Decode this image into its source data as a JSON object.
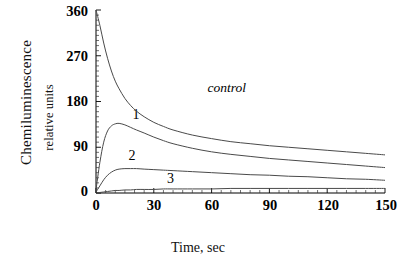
{
  "chart_data": {
    "type": "line",
    "title": "",
    "xlabel": "Time, sec",
    "ylabel": "Chemiluminescence relative units",
    "ylabel_line1": "Chemiluminescence",
    "ylabel_line2": "relative units",
    "xlim": [
      0,
      150
    ],
    "ylim": [
      0,
      360
    ],
    "xticks": [
      0,
      30,
      60,
      90,
      120,
      150
    ],
    "yticks": [
      0,
      90,
      180,
      270,
      360
    ],
    "xtick_labels": [
      "0",
      "30",
      "60",
      "90",
      "120",
      "150"
    ],
    "ytick_labels": [
      "0",
      "90",
      "180",
      "270",
      "360"
    ],
    "grid": false,
    "legend": "inline-curve-labels",
    "x": [
      0,
      2,
      4,
      6,
      8,
      10,
      12,
      15,
      18,
      21,
      25,
      30,
      35,
      40,
      50,
      60,
      70,
      80,
      90,
      100,
      110,
      120,
      130,
      140,
      150
    ],
    "series": [
      {
        "name": "control",
        "label": "control",
        "label_style": "italic",
        "values": [
          360,
          330,
          295,
          265,
          240,
          220,
          205,
          186,
          172,
          161,
          150,
          139,
          131,
          124,
          114,
          107,
          101,
          97,
          93,
          90,
          87,
          84,
          81,
          78,
          75
        ]
      },
      {
        "name": "1",
        "label": "1",
        "label_style": "plain",
        "values": [
          6,
          60,
          100,
          122,
          132,
          136,
          137,
          134,
          129,
          124,
          118,
          110,
          103,
          97,
          88,
          81,
          76,
          72,
          68,
          65,
          62,
          59,
          56,
          53,
          50
        ]
      },
      {
        "name": "2",
        "label": "2",
        "label_style": "plain",
        "values": [
          2,
          14,
          26,
          35,
          41,
          45,
          47,
          48,
          48,
          48,
          47,
          46,
          45,
          44,
          42,
          40,
          38,
          36,
          35,
          33,
          32,
          30,
          28,
          27,
          25
        ]
      },
      {
        "name": "3",
        "label": "3",
        "label_style": "plain",
        "values": [
          0,
          1,
          2,
          3,
          4,
          5,
          5,
          6,
          6,
          7,
          7,
          7,
          8,
          8,
          8,
          8,
          9,
          9,
          9,
          9,
          9,
          9,
          9,
          9,
          9
        ]
      }
    ],
    "curve_label_positions": [
      {
        "name": "control",
        "x": 61,
        "y": 205
      },
      {
        "name": "1",
        "x": 22,
        "y": 152
      },
      {
        "name": "2",
        "x": 20,
        "y": 70
      },
      {
        "name": "3",
        "x": 40,
        "y": 26
      }
    ],
    "colors": {
      "axis": "#000000",
      "curve": "#4a4a4a",
      "text": "#000000",
      "background": "#ffffff"
    }
  }
}
